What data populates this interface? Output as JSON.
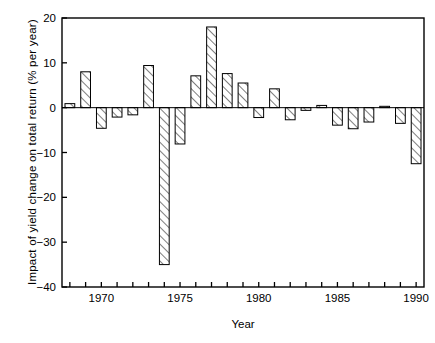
{
  "chart_data": {
    "type": "bar",
    "title": "",
    "xlabel": "Year",
    "ylabel": "Impact of yield change on total return (% per year)",
    "xlim": [
      1967.5,
      1990.5
    ],
    "ylim": [
      -40,
      20
    ],
    "yticks": [
      20,
      10,
      0,
      -10,
      -20,
      -30,
      -40
    ],
    "ytick_labels": [
      "20",
      "10",
      "0",
      "−10",
      "−20",
      "−30",
      "−40"
    ],
    "xticks": [
      1968,
      1969,
      1970,
      1971,
      1972,
      1973,
      1974,
      1975,
      1976,
      1977,
      1978,
      1979,
      1980,
      1981,
      1982,
      1983,
      1984,
      1985,
      1986,
      1987,
      1988,
      1989,
      1990
    ],
    "xtick_labels_shown": [
      "1970",
      "1975",
      "1980",
      "1985",
      "1990"
    ],
    "xtick_label_years": [
      1970,
      1975,
      1980,
      1985,
      1990
    ],
    "grid": false,
    "legend": false,
    "bar_fill": "hatch-diagonal",
    "bar_edge_color": "#000000",
    "categories": [
      1968,
      1969,
      1970,
      1971,
      1972,
      1973,
      1974,
      1975,
      1976,
      1977,
      1978,
      1979,
      1980,
      1981,
      1982,
      1983,
      1984,
      1985,
      1986,
      1987,
      1988,
      1989,
      1990
    ],
    "values": [
      0.9,
      8.0,
      -4.6,
      -2.1,
      -1.6,
      9.4,
      -35.0,
      -8.1,
      7.1,
      18.0,
      7.6,
      5.5,
      -2.2,
      4.2,
      -2.7,
      -0.6,
      0.5,
      -3.9,
      -4.7,
      -3.2,
      0.3,
      -3.5,
      -12.5
    ]
  }
}
